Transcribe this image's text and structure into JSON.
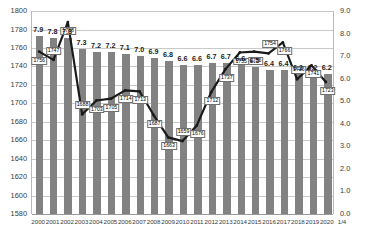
{
  "chart_data": {
    "type": "bar",
    "title": "",
    "subtitle": "",
    "xlabel": "",
    "ylabel": "",
    "grid": true,
    "legend": "none",
    "categories": [
      "2000",
      "2001",
      "2002",
      "2003",
      "2004",
      "2005",
      "2006",
      "2007",
      "2008",
      "2009",
      "2010",
      "2011",
      "2012",
      "2013",
      "2014",
      "2015",
      "2016",
      "2017",
      "2018",
      "2019",
      "2020"
    ],
    "x_extra_label": "1/4",
    "axes": {
      "left": {
        "min": 1580,
        "max": 1800,
        "step": 20,
        "ticks": [
          "1800",
          "1780",
          "1760",
          "1740",
          "1720",
          "1700",
          "1680",
          "1660",
          "1640",
          "1620",
          "1600",
          "1580"
        ]
      },
      "right": {
        "min": 0.0,
        "max": 9.0,
        "step": 1.0,
        "ticks": [
          "9.0",
          "8.0",
          "7.0",
          "6.0",
          "5.0",
          "4.0",
          "3.0",
          "2.0",
          "1.0",
          "0.0"
        ]
      }
    },
    "series": [
      {
        "name": "bars",
        "render": "bar",
        "axis": "right",
        "color": "#828282",
        "values": [
          7.9,
          7.8,
          7.8,
          7.3,
          7.2,
          7.2,
          7.1,
          7.0,
          6.9,
          6.8,
          6.6,
          6.6,
          6.7,
          6.7,
          6.6,
          6.5,
          6.4,
          6.4,
          6.2,
          6.2,
          6.2
        ],
        "labels": [
          "7.9",
          "7.8",
          "7.8",
          "7.3",
          "7.2",
          "7.2",
          "7.1",
          "7.0",
          "6.9",
          "6.8",
          "6.6",
          "6.6",
          "6.7",
          "6.7",
          "6.6",
          "6.5",
          "6.4",
          "6.4",
          "6.2",
          "6.2",
          "6.2"
        ]
      },
      {
        "name": "line",
        "render": "line",
        "axis": "left",
        "color": "#1a1a1a",
        "values": [
          1756,
          1747,
          1788,
          1688,
          1703,
          1705,
          1714,
          1713,
          1687,
          1663,
          1659,
          1676,
          1712,
          1737,
          1755,
          1756,
          1754,
          1766,
          1726,
          1741,
          1723
        ],
        "labels": [
          "1756",
          "1747",
          "1788",
          "1688",
          "1703",
          "1705",
          "1714",
          "1713",
          "1687",
          "1663",
          "1659",
          "1676",
          "1712",
          "1737",
          "1755",
          "1756",
          "1754",
          "1766",
          "1726",
          "1741",
          "1723"
        ]
      }
    ]
  }
}
